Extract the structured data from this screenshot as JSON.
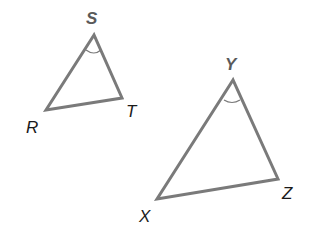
{
  "diagram": {
    "stroke_color": "#777777",
    "triangles": [
      {
        "name": "RST",
        "vertices": {
          "S": {
            "label": "S",
            "x": 94,
            "y": 35
          },
          "R": {
            "label": "R",
            "x": 46,
            "y": 110
          },
          "T": {
            "label": "T",
            "x": 122,
            "y": 98
          }
        },
        "angle_mark": "S"
      },
      {
        "name": "XYZ",
        "vertices": {
          "Y": {
            "label": "Y",
            "x": 233,
            "y": 80
          },
          "X": {
            "label": "X",
            "x": 157,
            "y": 199
          },
          "Z": {
            "label": "Z",
            "x": 278,
            "y": 179
          }
        },
        "angle_mark": "Y"
      }
    ]
  }
}
